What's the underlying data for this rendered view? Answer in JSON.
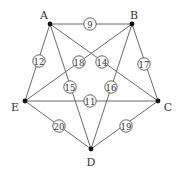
{
  "graph": {
    "nodes": [
      {
        "id": "A",
        "label": "A",
        "x": 50,
        "y": 24,
        "lx": 44,
        "ly": 15
      },
      {
        "id": "B",
        "label": "B",
        "x": 132,
        "y": 24,
        "lx": 134,
        "ly": 15
      },
      {
        "id": "C",
        "label": "C",
        "x": 158,
        "y": 101,
        "lx": 168,
        "ly": 107
      },
      {
        "id": "D",
        "label": "D",
        "x": 91,
        "y": 149,
        "lx": 91,
        "ly": 162
      },
      {
        "id": "E",
        "label": "E",
        "x": 25,
        "y": 101,
        "lx": 15,
        "ly": 107
      }
    ],
    "edges": [
      {
        "from": "A",
        "to": "B",
        "weight": "9",
        "wx": 90,
        "wy": 24
      },
      {
        "from": "A",
        "to": "E",
        "weight": "12",
        "wx": 39,
        "wy": 61
      },
      {
        "from": "A",
        "to": "D",
        "weight": "15",
        "wx": 70,
        "wy": 87
      },
      {
        "from": "A",
        "to": "C",
        "weight": "14",
        "wx": 102,
        "wy": 62
      },
      {
        "from": "B",
        "to": "E",
        "weight": "18",
        "wx": 79,
        "wy": 62
      },
      {
        "from": "B",
        "to": "D",
        "weight": "16",
        "wx": 111,
        "wy": 87
      },
      {
        "from": "B",
        "to": "C",
        "weight": "17",
        "wx": 144,
        "wy": 64
      },
      {
        "from": "E",
        "to": "C",
        "weight": "11",
        "wx": 90,
        "wy": 101
      },
      {
        "from": "E",
        "to": "D",
        "weight": "20",
        "wx": 59,
        "wy": 126
      },
      {
        "from": "C",
        "to": "D",
        "weight": "19",
        "wx": 126,
        "wy": 126
      }
    ]
  }
}
